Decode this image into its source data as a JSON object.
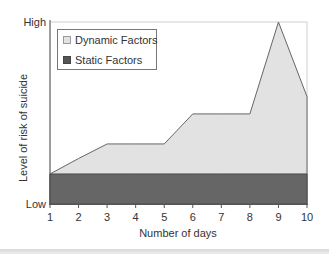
{
  "chart_data": {
    "type": "area",
    "title": "",
    "xlabel": "Number of days",
    "ylabel": "Level of risk of suicide",
    "x": [
      1,
      2,
      3,
      4,
      5,
      6,
      7,
      8,
      9,
      10
    ],
    "x_ticks": [
      "1",
      "2",
      "3",
      "4",
      "5",
      "6",
      "7",
      "8",
      "9",
      "10"
    ],
    "y_ticks": [
      {
        "label": "High",
        "value": 100
      },
      {
        "label": "Low",
        "value": 0
      }
    ],
    "ylim": [
      0,
      100
    ],
    "xlim": [
      1,
      10
    ],
    "grid": false,
    "legend_position": "upper-left",
    "series": [
      {
        "name": "Dynamic Factors",
        "color": "#e2e2e2",
        "stroke": "#666666",
        "values": [
          16.5,
          25,
          33,
          33,
          33,
          49.5,
          49.5,
          49.5,
          100,
          59
        ]
      },
      {
        "name": "Static Factors",
        "color": "#666666",
        "stroke": "#444444",
        "values": [
          16.5,
          16.5,
          16.5,
          16.5,
          16.5,
          16.5,
          16.5,
          16.5,
          16.5,
          16.5
        ]
      }
    ]
  },
  "legend": {
    "items": [
      {
        "label": "Dynamic Factors",
        "color": "#e2e2e2"
      },
      {
        "label": "Static Factors",
        "color": "#666666"
      }
    ]
  },
  "axes": {
    "y_high": "High",
    "y_low": "Low",
    "xlabel": "Number of days",
    "ylabel": "Level of risk of suicide"
  }
}
